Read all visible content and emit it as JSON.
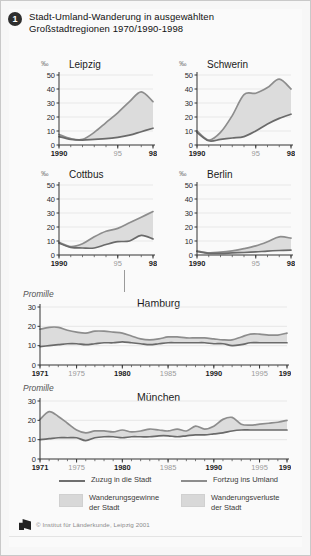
{
  "header": {
    "number": "1",
    "title_line1": "Stadt-Umland-Wanderung in ausgewählten",
    "title_line2": "Großstadtregionen 1970/1990-1998"
  },
  "legend": {
    "line_in_label": "Zuzug in die Stadt",
    "line_out_label": "Fortzug ins Umland",
    "area_gain_label": "Wanderungsgewinne\nder Stadt",
    "area_loss_label": "Wanderungsverluste\nder Stadt",
    "credit": "© Institut für Länderkunde, Leipzig 2001",
    "color_line_in": "#6f6f6f",
    "color_line_out": "#8d8d8d",
    "color_area": "#d8d8d8"
  },
  "chart_data": [
    {
      "type": "area",
      "title": "Leipzig",
      "ylabel": "‰",
      "xlabel": "",
      "ylim": [
        0,
        50
      ],
      "yticks": [
        0,
        10,
        20,
        30,
        40,
        50
      ],
      "x": [
        1990,
        1991,
        1992,
        1993,
        1994,
        1995,
        1996,
        1997,
        1998
      ],
      "xticks": [
        "1990",
        "95",
        "98"
      ],
      "grid": true,
      "series": [
        {
          "name": "Zuzug in die Stadt",
          "values": [
            6,
            4,
            3.5,
            4,
            4.5,
            5.5,
            7,
            9.5,
            12
          ]
        },
        {
          "name": "Fortzug ins Umland",
          "values": [
            7.5,
            4.5,
            4,
            9,
            16,
            23,
            31,
            38,
            31
          ]
        }
      ]
    },
    {
      "type": "area",
      "title": "Schwerin",
      "ylabel": "‰",
      "xlabel": "",
      "ylim": [
        0,
        50
      ],
      "yticks": [
        0,
        10,
        20,
        30,
        40,
        50
      ],
      "x": [
        1990,
        1991,
        1992,
        1993,
        1994,
        1995,
        1996,
        1997,
        1998
      ],
      "xticks": [
        "1990",
        "95",
        "98"
      ],
      "grid": true,
      "series": [
        {
          "name": "Zuzug in die Stadt",
          "values": [
            9,
            3,
            4,
            5,
            6,
            10,
            15,
            19,
            22
          ]
        },
        {
          "name": "Fortzug ins Umland",
          "values": [
            10,
            3.5,
            9,
            21,
            36,
            37,
            41,
            47,
            40
          ]
        }
      ]
    },
    {
      "type": "area",
      "title": "Cottbus",
      "ylabel": "‰",
      "xlabel": "",
      "ylim": [
        0,
        50
      ],
      "yticks": [
        0,
        10,
        20,
        30,
        40,
        50
      ],
      "x": [
        1990,
        1991,
        1992,
        1993,
        1994,
        1995,
        1996,
        1997,
        1998
      ],
      "xticks": [
        "1990",
        "95",
        "98"
      ],
      "grid": true,
      "series": [
        {
          "name": "Zuzug in die Stadt",
          "values": [
            8.5,
            5.5,
            5,
            5,
            7.5,
            9.5,
            10,
            14,
            11.5
          ]
        },
        {
          "name": "Fortzug ins Umland",
          "values": [
            9,
            6,
            8,
            13,
            17,
            19,
            23,
            27,
            31
          ]
        }
      ]
    },
    {
      "type": "area",
      "title": "Berlin",
      "ylabel": "‰",
      "xlabel": "",
      "ylim": [
        0,
        50
      ],
      "yticks": [
        0,
        10,
        20,
        30,
        40,
        50
      ],
      "x": [
        1990,
        1991,
        1992,
        1993,
        1994,
        1995,
        1996,
        1997,
        1998
      ],
      "xticks": [
        "1990",
        "95",
        "98"
      ],
      "grid": true,
      "series": [
        {
          "name": "Zuzug in die Stadt",
          "values": [
            2.5,
            1.2,
            1.2,
            1.5,
            1.8,
            2.2,
            2.8,
            3.2,
            3.5
          ]
        },
        {
          "name": "Fortzug ins Umland",
          "values": [
            3,
            1.5,
            2,
            3,
            4.5,
            6.5,
            9.5,
            13,
            12
          ]
        }
      ]
    },
    {
      "type": "area",
      "title": "Hamburg",
      "ylabel": "Promille",
      "xlabel": "",
      "ylim": [
        0,
        30
      ],
      "yticks": [
        0,
        10,
        20,
        30
      ],
      "x": [
        1971,
        1972,
        1973,
        1974,
        1975,
        1976,
        1977,
        1978,
        1979,
        1980,
        1981,
        1982,
        1983,
        1984,
        1985,
        1986,
        1987,
        1988,
        1989,
        1990,
        1991,
        1992,
        1993,
        1994,
        1995,
        1996,
        1997,
        1998
      ],
      "xticks": [
        "1971",
        "1975",
        "1980",
        "1985",
        "1990",
        "1995",
        "1998"
      ],
      "grid": true,
      "series": [
        {
          "name": "Zuzug in die Stadt",
          "values": [
            9.5,
            10,
            10.5,
            11,
            11,
            10.5,
            11,
            11.5,
            11.5,
            12,
            11.5,
            11,
            10.5,
            11,
            11.5,
            11.5,
            11.5,
            11.5,
            11.5,
            11,
            11,
            10,
            10.5,
            11.5,
            11.5,
            11.5,
            11.5,
            11.5
          ]
        },
        {
          "name": "Fortzug ins Umland",
          "values": [
            18.5,
            19.5,
            19.5,
            18,
            17,
            16.5,
            17.5,
            17.5,
            17,
            16.5,
            15,
            13.5,
            13,
            13.5,
            14.5,
            14.5,
            14,
            14,
            14,
            13.5,
            13,
            13,
            14.5,
            16,
            16,
            15.5,
            15.5,
            16.5
          ]
        }
      ]
    },
    {
      "type": "area",
      "title": "München",
      "ylabel": "Promille",
      "xlabel": "",
      "ylim": [
        0,
        30
      ],
      "yticks": [
        0,
        10,
        20,
        30
      ],
      "x": [
        1971,
        1972,
        1973,
        1974,
        1975,
        1976,
        1977,
        1978,
        1979,
        1980,
        1981,
        1982,
        1983,
        1984,
        1985,
        1986,
        1987,
        1988,
        1989,
        1990,
        1991,
        1992,
        1993,
        1994,
        1995,
        1996,
        1997,
        1998
      ],
      "xticks": [
        "1971",
        "1975",
        "1980",
        "1985",
        "1990",
        "1995",
        "1998"
      ],
      "grid": true,
      "series": [
        {
          "name": "Zuzug in die Stadt",
          "values": [
            10,
            10.5,
            11,
            11,
            11,
            9.5,
            11,
            11.5,
            11.5,
            11,
            11.5,
            11.5,
            11.5,
            12,
            12,
            11.5,
            12,
            12.5,
            12.5,
            13,
            13.5,
            14.5,
            15,
            15,
            15,
            15,
            15,
            15
          ]
        },
        {
          "name": "Fortzug ins Umland",
          "values": [
            20.5,
            24.5,
            22,
            18.5,
            15,
            13.5,
            14.5,
            14.5,
            14,
            15,
            14,
            14.5,
            15.5,
            15,
            14.5,
            15.5,
            14.5,
            17,
            15.5,
            17,
            20.5,
            21.5,
            18,
            17.5,
            18,
            18.5,
            19,
            20
          ]
        }
      ]
    }
  ]
}
